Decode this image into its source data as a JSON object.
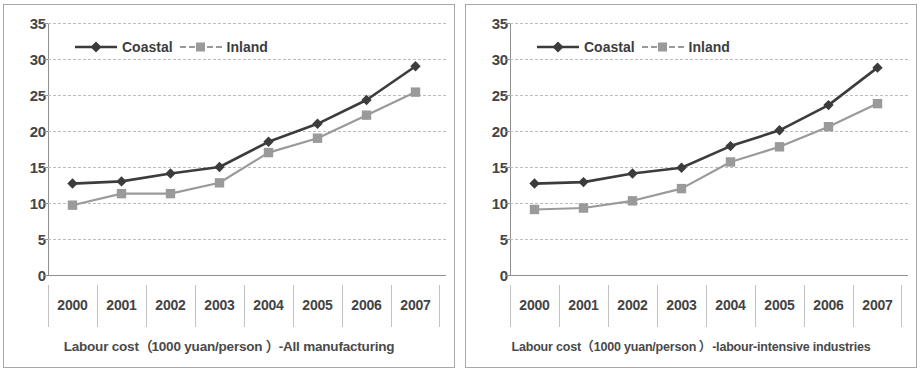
{
  "charts": [
    {
      "id": "all-manufacturing",
      "caption": "Labour cost（1000 yuan/person ）-All manufacturing",
      "chart_data": {
        "type": "line",
        "title": "Labour cost（1000 yuan/person ）-All manufacturing",
        "xlabel": "",
        "ylabel": "",
        "ylim": [
          0,
          35
        ],
        "ytick_step": 5,
        "yticks": [
          "35",
          "30",
          "25",
          "20",
          "15",
          "10",
          "5",
          "0"
        ],
        "grid": true,
        "legend_position": "top-left",
        "categories": [
          "2000",
          "2001",
          "2002",
          "2003",
          "2004",
          "2005",
          "2006",
          "2007"
        ],
        "series": [
          {
            "name": "Coastal",
            "marker": "diamond",
            "color": "#3c3c3c",
            "values": [
              12.7,
              13.0,
              14.1,
              15.0,
              18.5,
              21.0,
              24.3,
              29.0
            ]
          },
          {
            "name": "Inland",
            "marker": "square",
            "color": "#9a9a9a",
            "values": [
              9.7,
              11.3,
              11.3,
              12.8,
              17.0,
              19.0,
              22.2,
              25.4
            ]
          }
        ]
      }
    },
    {
      "id": "labour-intensive-industries",
      "caption": "Labour cost（1000 yuan/person ）-labour-intensive industries",
      "chart_data": {
        "type": "line",
        "title": "Labour cost（1000 yuan/person ）-labour-intensive industries",
        "xlabel": "",
        "ylabel": "",
        "ylim": [
          0,
          35
        ],
        "ytick_step": 5,
        "yticks": [
          "35",
          "30",
          "25",
          "20",
          "15",
          "10",
          "5",
          "0"
        ],
        "grid": true,
        "legend_position": "top-left",
        "categories": [
          "2000",
          "2001",
          "2002",
          "2003",
          "2004",
          "2005",
          "2006",
          "2007"
        ],
        "series": [
          {
            "name": "Coastal",
            "marker": "diamond",
            "color": "#3c3c3c",
            "values": [
              12.7,
              12.9,
              14.1,
              14.9,
              17.9,
              20.1,
              23.6,
              28.8
            ]
          },
          {
            "name": "Inland",
            "marker": "square",
            "color": "#9a9a9a",
            "values": [
              9.1,
              9.3,
              10.3,
              12.0,
              15.7,
              17.8,
              20.6,
              23.8
            ]
          }
        ]
      }
    }
  ],
  "colors": {
    "coastal": "#3c3c3c",
    "inland": "#9a9a9a",
    "gridline": "#bdbdbd",
    "axis": "#8f8f8f",
    "text": "#444444",
    "panel_border": "#a8a8a8"
  }
}
